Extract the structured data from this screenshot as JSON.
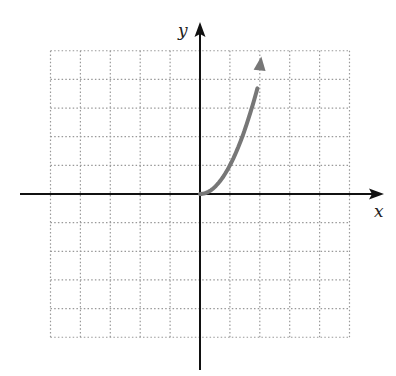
{
  "chart_data": {
    "type": "line",
    "title": "",
    "xlabel": "x",
    "ylabel": "y",
    "xlim": [
      -5,
      5
    ],
    "ylim": [
      -5,
      5
    ],
    "grid": true,
    "grid_style": "dotted",
    "legend": null,
    "series": [
      {
        "name": "curve",
        "description": "y = x^2 for x >= 0, starting at origin, arrow indicating continuation",
        "color": "#777777",
        "x": [
          0,
          0.25,
          0.5,
          0.75,
          1.0,
          1.25,
          1.5,
          1.75,
          2.0
        ],
        "y": [
          0,
          0.0625,
          0.25,
          0.5625,
          1.0,
          1.5625,
          2.25,
          3.0625,
          4.0
        ],
        "start_point": [
          0,
          0
        ],
        "end_arrow": true,
        "arrow_tip_approx": [
          2.05,
          4.8
        ]
      }
    ]
  },
  "axes": {
    "x_label": "x",
    "y_label": "y",
    "axis_color": "#111111",
    "grid_color": "#999999"
  }
}
